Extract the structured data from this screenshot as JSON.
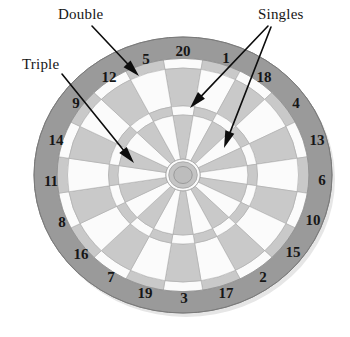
{
  "figure": {
    "background_color": "#ffffff"
  },
  "annotations": {
    "double": {
      "label": "Double",
      "x": 58,
      "y": 6
    },
    "triple": {
      "label": "Triple",
      "x": 22,
      "y": 56
    },
    "singles": {
      "label": "Singles",
      "x": 258,
      "y": 6
    }
  },
  "arrows": [
    {
      "name": "double-arrow",
      "from": [
        92,
        26
      ],
      "to": [
        139,
        76
      ]
    },
    {
      "name": "triple-arrow",
      "from": [
        62,
        74
      ],
      "to": [
        134,
        163
      ]
    },
    {
      "name": "singles-arrow-outer",
      "from": [
        268,
        26
      ],
      "to": [
        190,
        108
      ]
    },
    {
      "name": "singles-arrow-inner",
      "from": [
        271,
        27
      ],
      "to": [
        224,
        148
      ]
    }
  ],
  "board": {
    "center": [
      183,
      175
    ],
    "radius_x": 149,
    "radius_y": 138,
    "sectors": 20,
    "numbers": [
      20,
      1,
      18,
      4,
      13,
      6,
      10,
      15,
      2,
      17,
      3,
      19,
      7,
      16,
      8,
      11,
      14,
      9,
      12,
      5
    ],
    "number_positions": [
      {
        "value": "20",
        "x": 183,
        "y": 53
      },
      {
        "value": "1",
        "x": 226,
        "y": 60
      },
      {
        "value": "18",
        "x": 264,
        "y": 79
      },
      {
        "value": "4",
        "x": 296,
        "y": 105
      },
      {
        "value": "13",
        "x": 317,
        "y": 142
      },
      {
        "value": "6",
        "x": 322,
        "y": 182
      },
      {
        "value": "10",
        "x": 313,
        "y": 222
      },
      {
        "value": "15",
        "x": 293,
        "y": 254
      },
      {
        "value": "2",
        "x": 263,
        "y": 279
      },
      {
        "value": "17",
        "x": 226,
        "y": 295
      },
      {
        "value": "3",
        "x": 184,
        "y": 300
      },
      {
        "value": "19",
        "x": 145,
        "y": 295
      },
      {
        "value": "7",
        "x": 111,
        "y": 279
      },
      {
        "value": "16",
        "x": 81,
        "y": 256
      },
      {
        "value": "8",
        "x": 62,
        "y": 224
      },
      {
        "value": "11",
        "x": 51,
        "y": 183
      },
      {
        "value": "14",
        "x": 56,
        "y": 142
      },
      {
        "value": "9",
        "x": 76,
        "y": 105
      },
      {
        "value": "12",
        "x": 109,
        "y": 79
      },
      {
        "value": "5",
        "x": 146,
        "y": 61
      }
    ],
    "rings": {
      "number_ring": {
        "name": "number-ring",
        "color": "#9a9a9a",
        "outer": 1.0,
        "inner": 0.845
      },
      "double_ring": {
        "name": "double-ring",
        "outer": 0.845,
        "inner": 0.775
      },
      "outer_single": {
        "name": "outer-single",
        "outer": 0.775,
        "inner": 0.5
      },
      "triple_ring": {
        "name": "triple-ring",
        "outer": 0.5,
        "inner": 0.435
      },
      "inner_single": {
        "name": "inner-single",
        "outer": 0.435,
        "inner": 0.115
      },
      "outer_bull": {
        "name": "outer-bull",
        "outer": 0.115,
        "inner": 0.062
      },
      "inner_bull": {
        "name": "inner-bull",
        "outer": 0.062,
        "inner": 0.0
      }
    },
    "colors": {
      "number_ring": "#9a9a9a",
      "segment_light": "#c9c9c9",
      "segment_white": "#fbfbfb",
      "ring_mid": "#b4b4b4",
      "bull_ring": "#c4c4c4",
      "bull_center": "#bdbdbd",
      "outline": "#8e8e8e",
      "text": "#161616",
      "arrow": "#0d0d0d"
    }
  }
}
